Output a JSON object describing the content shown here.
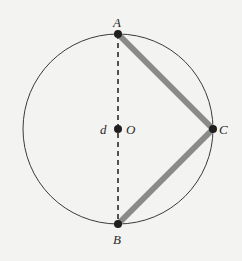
{
  "diagram": {
    "type": "circle-geometry",
    "background": "#f3f3f1",
    "circle": {
      "cx": 118,
      "cy": 129,
      "r": 95,
      "stroke": "#3a3a3a",
      "stroke_width": 1
    },
    "diameter": {
      "from": "A",
      "to": "B",
      "style": "dashed",
      "stroke": "#2a2a2a",
      "stroke_width": 1.6,
      "dasharray": "5,4"
    },
    "chords": [
      {
        "from": "A",
        "to": "C",
        "stroke": "#8a8a8a",
        "stroke_width": 6
      },
      {
        "from": "C",
        "to": "B",
        "stroke": "#8a8a8a",
        "stroke_width": 6
      }
    ],
    "points": {
      "A": {
        "x": 118,
        "y": 34,
        "label": "A",
        "label_x": 113,
        "label_y": 27
      },
      "B": {
        "x": 118,
        "y": 224,
        "label": "B",
        "label_x": 113,
        "label_y": 244
      },
      "C": {
        "x": 213,
        "y": 129,
        "label": "C",
        "label_x": 219,
        "label_y": 134
      },
      "O": {
        "x": 118,
        "y": 129,
        "label": "O",
        "label_x": 126,
        "label_y": 134
      }
    },
    "point_radius": 4,
    "point_fill": "#1f1f1f",
    "extra_labels": {
      "d": {
        "text": "d",
        "x": 100,
        "y": 134
      }
    }
  }
}
